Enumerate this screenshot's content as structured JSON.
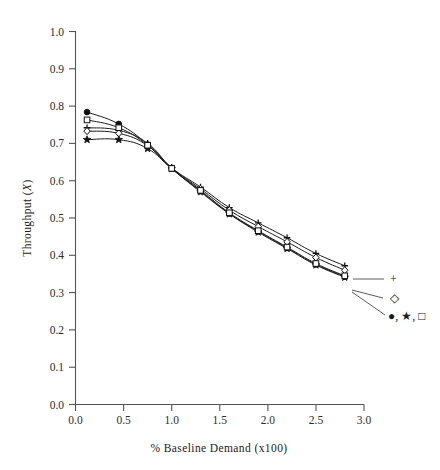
{
  "chart_data": {
    "type": "line",
    "title": "",
    "xlabel": "% Baseline Demand (x100)",
    "ylabel": "Throughput (X)",
    "ylabel_plain": "Throughput",
    "ylabel_symbol": "X",
    "xlim": [
      0.0,
      3.0
    ],
    "ylim": [
      0.0,
      1.0
    ],
    "xticks": [
      "0.0",
      "0.5",
      "1.0",
      "1.5",
      "2.0",
      "2.5",
      "3.0"
    ],
    "xtick_values": [
      0.0,
      0.5,
      1.0,
      1.5,
      2.0,
      2.5,
      3.0
    ],
    "yticks": [
      "0.0",
      "0.1",
      "0.2",
      "0.3",
      "0.4",
      "0.5",
      "0.6",
      "0.7",
      "0.8",
      "0.9",
      "1.0"
    ],
    "ytick_values": [
      0.0,
      0.1,
      0.2,
      0.3,
      0.4,
      0.5,
      0.6,
      0.7,
      0.8,
      0.9,
      1.0
    ],
    "grid": false,
    "legend_position": "right-inline-annotations",
    "x": [
      0.12,
      0.45,
      0.75,
      1.0,
      1.3,
      1.6,
      1.9,
      2.2,
      2.5,
      2.8
    ],
    "series": [
      {
        "name": "plus",
        "marker": "plus",
        "marker_label": "+",
        "values": [
          0.742,
          0.735,
          0.7,
          0.635,
          0.583,
          0.528,
          0.487,
          0.447,
          0.405,
          0.372
        ]
      },
      {
        "name": "open-diamond",
        "marker": "open-diamond",
        "marker_label": "◇",
        "values": [
          0.733,
          0.727,
          0.694,
          0.634,
          0.578,
          0.521,
          0.477,
          0.436,
          0.394,
          0.36
        ]
      },
      {
        "name": "filled-circle",
        "marker": "filled-circle",
        "marker_label": "●",
        "values": [
          0.784,
          0.752,
          0.697,
          0.633,
          0.572,
          0.512,
          0.464,
          0.42,
          0.376,
          0.343
        ]
      },
      {
        "name": "filled-star",
        "marker": "filled-star",
        "marker_label": "★",
        "values": [
          0.71,
          0.71,
          0.686,
          0.632,
          0.57,
          0.511,
          0.462,
          0.418,
          0.374,
          0.341
        ]
      },
      {
        "name": "open-square",
        "marker": "open-square",
        "marker_label": "□",
        "values": [
          0.763,
          0.742,
          0.695,
          0.633,
          0.574,
          0.514,
          0.466,
          0.422,
          0.378,
          0.345
        ]
      }
    ],
    "annotations": [
      {
        "id": "annot-plus",
        "label": "+",
        "points_to_series": "plus"
      },
      {
        "id": "annot-open-diamond",
        "label": "◇",
        "points_to_series": "open-diamond"
      },
      {
        "id": "annot-group",
        "label": "●, ★, □",
        "points_to_series": "filled-circle, filled-star, open-square"
      }
    ]
  }
}
